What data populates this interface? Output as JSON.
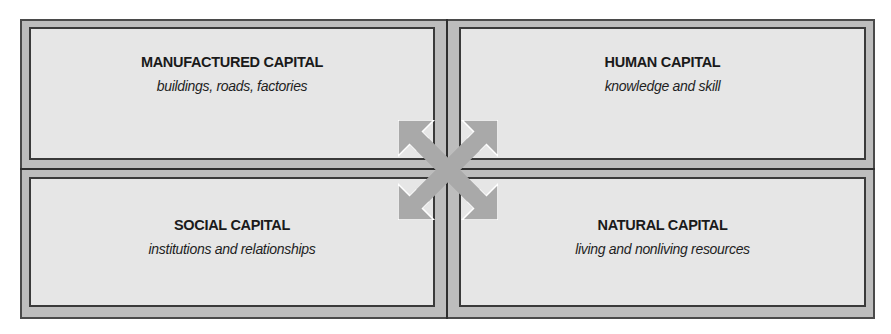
{
  "diagram": {
    "panels": [
      {
        "title": "MANUFACTURED CAPITAL",
        "subtitle": "buildings, roads, factories"
      },
      {
        "title": "HUMAN CAPITAL",
        "subtitle": "knowledge and skill"
      },
      {
        "title": "SOCIAL CAPITAL",
        "subtitle": "institutions and relationships"
      },
      {
        "title": "NATURAL CAPITAL",
        "subtitle": "living and nonliving resources"
      }
    ],
    "center_icon": "four-way-diagonal-arrows-icon",
    "colors": {
      "frame": "#bdbdbd",
      "panel": "#e6e6e6",
      "border": "#3a3a3a",
      "arrow": "#a9a9a9"
    }
  }
}
